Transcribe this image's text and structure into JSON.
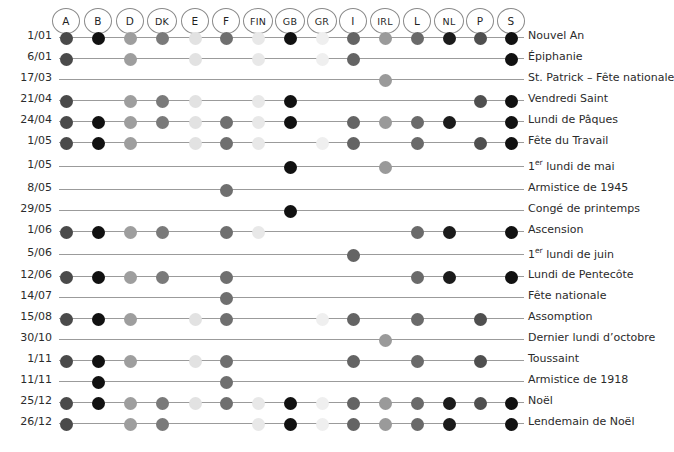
{
  "chart_data": {
    "type": "heatmap",
    "title": "",
    "xlabel": "",
    "ylabel": "",
    "legend": "none",
    "grid": false,
    "columns": [
      {
        "code": "A",
        "x": 66,
        "color": "#4a4a4a"
      },
      {
        "code": "B",
        "x": 98,
        "color": "#111111"
      },
      {
        "code": "D",
        "x": 130,
        "color": "#9e9e9e"
      },
      {
        "code": "DK",
        "x": 162,
        "color": "#7a7a7a"
      },
      {
        "code": "E",
        "x": 195,
        "color": "#e2e2e2"
      },
      {
        "code": "F",
        "x": 226,
        "color": "#6f6f6f"
      },
      {
        "code": "FIN",
        "x": 258,
        "color": "#e8e8e8"
      },
      {
        "code": "GB",
        "x": 290,
        "color": "#111111"
      },
      {
        "code": "GR",
        "x": 322,
        "color": "#efefef"
      },
      {
        "code": "I",
        "x": 353,
        "color": "#646464"
      },
      {
        "code": "IRL",
        "x": 385,
        "color": "#9a9a9a"
      },
      {
        "code": "L",
        "x": 417,
        "color": "#6a6a6a"
      },
      {
        "code": "NL",
        "x": 449,
        "color": "#1b1b1b"
      },
      {
        "code": "P",
        "x": 480,
        "color": "#4f4f4f"
      },
      {
        "code": "S",
        "x": 511,
        "color": "#111111"
      }
    ],
    "rows": [
      {
        "date": "1/01",
        "name": "Nouvel An",
        "y": 38,
        "countries": [
          "A",
          "B",
          "D",
          "DK",
          "E",
          "F",
          "FIN",
          "GB",
          "GR",
          "I",
          "IRL",
          "L",
          "NL",
          "P",
          "S"
        ]
      },
      {
        "date": "6/01",
        "name": "Épiphanie",
        "y": 59,
        "countries": [
          "A",
          "D",
          "E",
          "FIN",
          "GR",
          "I",
          "S"
        ]
      },
      {
        "date": "17/03",
        "name": "St. Patrick – Fête nationale",
        "y": 80,
        "countries": [
          "IRL"
        ]
      },
      {
        "date": "21/04",
        "name": "Vendredi Saint",
        "y": 101,
        "countries": [
          "A",
          "D",
          "DK",
          "E",
          "FIN",
          "GB",
          "P",
          "S"
        ]
      },
      {
        "date": "24/04",
        "name": "Lundi de Pâques",
        "y": 122,
        "countries": [
          "A",
          "B",
          "D",
          "DK",
          "E",
          "F",
          "FIN",
          "GB",
          "I",
          "IRL",
          "L",
          "NL",
          "S"
        ]
      },
      {
        "date": "1/05",
        "name": "Fête du Travail",
        "y": 143,
        "countries": [
          "A",
          "B",
          "D",
          "E",
          "F",
          "FIN",
          "GR",
          "I",
          "L",
          "P",
          "S"
        ]
      },
      {
        "date": "1/05",
        "name_html": "1<sup>er</sup> lundi de mai",
        "name": "1er lundi de mai",
        "y": 167,
        "countries": [
          "GB",
          "IRL"
        ]
      },
      {
        "date": "8/05",
        "name": "Armistice de 1945",
        "y": 190,
        "countries": [
          "F"
        ]
      },
      {
        "date": "29/05",
        "name": "Congé de printemps",
        "y": 211,
        "countries": [
          "GB"
        ]
      },
      {
        "date": "1/06",
        "name": "Ascension",
        "y": 232,
        "countries": [
          "A",
          "B",
          "D",
          "DK",
          "F",
          "FIN",
          "L",
          "NL",
          "S"
        ]
      },
      {
        "date": "5/06",
        "name_html": "1<sup>er</sup> lundi de juin",
        "name": "1er lundi de juin",
        "y": 255,
        "countries": [
          "I"
        ]
      },
      {
        "date": "12/06",
        "name": "Lundi de Pentecôte",
        "y": 277,
        "countries": [
          "A",
          "B",
          "D",
          "DK",
          "F",
          "L",
          "NL",
          "S"
        ]
      },
      {
        "date": "14/07",
        "name": "Fête nationale",
        "y": 298,
        "countries": [
          "F"
        ]
      },
      {
        "date": "15/08",
        "name": "Assomption",
        "y": 319,
        "countries": [
          "A",
          "B",
          "D",
          "E",
          "F",
          "GR",
          "I",
          "L",
          "P"
        ]
      },
      {
        "date": "30/10",
        "name": "Dernier lundi d’octobre",
        "y": 340,
        "countries": [
          "IRL"
        ]
      },
      {
        "date": "1/11",
        "name": "Toussaint",
        "y": 361,
        "countries": [
          "A",
          "B",
          "D",
          "E",
          "F",
          "I",
          "L",
          "P"
        ]
      },
      {
        "date": "11/11",
        "name": "Armistice de 1918",
        "y": 382,
        "countries": [
          "B",
          "F"
        ]
      },
      {
        "date": "25/12",
        "name": "Noël",
        "y": 403,
        "countries": [
          "A",
          "B",
          "D",
          "DK",
          "E",
          "F",
          "FIN",
          "GB",
          "GR",
          "I",
          "IRL",
          "L",
          "NL",
          "P",
          "S"
        ]
      },
      {
        "date": "26/12",
        "name": "Lendemain de Noël",
        "y": 424,
        "countries": [
          "A",
          "D",
          "DK",
          "FIN",
          "GB",
          "GR",
          "I",
          "IRL",
          "L",
          "NL",
          "S"
        ]
      }
    ]
  },
  "style": {
    "line_color": "#9b9b9b",
    "chip_border": "#8a8a8a",
    "text_color": "#2b2b2b",
    "background": "#ffffff"
  }
}
